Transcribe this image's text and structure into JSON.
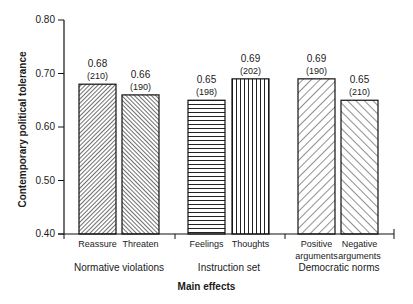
{
  "chart_data": {
    "type": "bar",
    "title": "",
    "xlabel": "Main effects",
    "ylabel": "Contemporary political tolerance",
    "ylim": [
      0.4,
      0.8
    ],
    "yticks": [
      "0.40",
      "0.50",
      "0.60",
      "0.70",
      "0.80"
    ],
    "grid": false,
    "legend": null,
    "groups": [
      {
        "name": "Normative violations",
        "bars": [
          {
            "category": "Reassure",
            "value": 0.68,
            "n": 210,
            "pattern": "dense-backslash-hatch"
          },
          {
            "category": "Threaten",
            "value": 0.66,
            "n": 190,
            "pattern": "dense-slash-hatch"
          }
        ]
      },
      {
        "name": "Instruction set",
        "bars": [
          {
            "category": "Feelings",
            "value": 0.65,
            "n": 198,
            "pattern": "horizontal-lines"
          },
          {
            "category": "Thoughts",
            "value": 0.69,
            "n": 202,
            "pattern": "vertical-lines"
          }
        ]
      },
      {
        "name": "Democratic norms",
        "bars": [
          {
            "category": "Positive arguments",
            "value": 0.69,
            "n": 190,
            "pattern": "wide-backslash-hatch"
          },
          {
            "category": "Negative arguments",
            "value": 0.65,
            "n": 210,
            "pattern": "wide-slash-hatch"
          }
        ]
      }
    ],
    "categories": [
      "Reassure",
      "Threaten",
      "Feelings",
      "Thoughts",
      "Positive arguments",
      "Negative arguments"
    ],
    "values": [
      0.68,
      0.66,
      0.65,
      0.69,
      0.69,
      0.65
    ],
    "sample_sizes": [
      210,
      190,
      198,
      202,
      190,
      210
    ],
    "value_labels": [
      "0.68",
      "0.66",
      "0.65",
      "0.69",
      "0.69",
      "0.65"
    ],
    "n_labels": [
      "(210)",
      "(190)",
      "(198)",
      "(202)",
      "(190)",
      "(210)"
    ]
  },
  "labels": {
    "ytitle": "Contemporary political tolerance",
    "xtitle": "Main effects",
    "yticks": [
      "0.80",
      "0.70",
      "0.60",
      "0.50",
      "0.40"
    ],
    "groups": [
      "Normative violations",
      "Instruction set",
      "Democratic norms"
    ],
    "cats": [
      [
        "Reassure"
      ],
      [
        "Threaten"
      ],
      [
        "Feelings"
      ],
      [
        "Thoughts"
      ],
      [
        "Positive",
        "arguments"
      ],
      [
        "Negative",
        "arguments"
      ]
    ]
  }
}
